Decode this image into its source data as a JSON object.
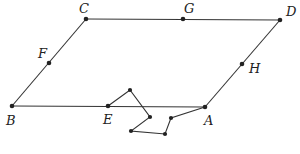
{
  "diagram": {
    "type": "parallelogram-with-path",
    "points": {
      "A": {
        "label": "A",
        "x": 205,
        "y": 107
      },
      "B": {
        "label": "B",
        "x": 12,
        "y": 106
      },
      "C": {
        "label": "C",
        "x": 86,
        "y": 19
      },
      "D": {
        "label": "D",
        "x": 280,
        "y": 20
      },
      "E": {
        "label": "E",
        "x": 108,
        "y": 106
      },
      "F": {
        "label": "F",
        "x": 49,
        "y": 63
      },
      "G": {
        "label": "G",
        "x": 183,
        "y": 19
      },
      "H": {
        "label": "H",
        "x": 242,
        "y": 64
      }
    },
    "edges": [
      [
        "B",
        "C"
      ],
      [
        "C",
        "D"
      ],
      [
        "D",
        "A"
      ],
      [
        "A",
        "B"
      ]
    ],
    "path_points": [
      [
        108,
        106
      ],
      [
        130,
        90
      ],
      [
        150,
        117
      ],
      [
        131,
        131
      ],
      [
        165,
        134
      ],
      [
        171,
        118
      ],
      [
        205,
        107
      ]
    ],
    "labels": {
      "A": "A",
      "B": "B",
      "C": "C",
      "D": "D",
      "E": "E",
      "F": "F",
      "G": "G",
      "H": "H"
    },
    "colors": {
      "stroke": "#333333",
      "point": "#222222",
      "background": "#ffffff"
    }
  }
}
